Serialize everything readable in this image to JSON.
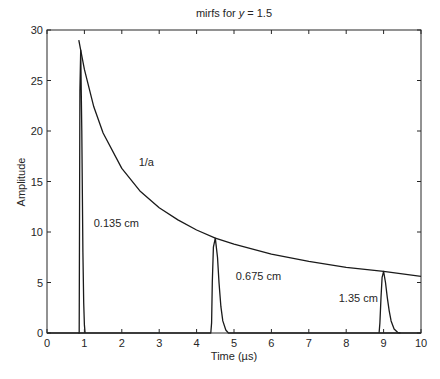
{
  "chart_data": {
    "type": "line",
    "title": "mirfs for y = 1.5",
    "title_prefix": "mirfs for ",
    "title_var": "y",
    "title_suffix": " = 1.5",
    "xlabel": "Time (µs)",
    "ylabel": "Amplitude",
    "xlim": [
      0,
      10
    ],
    "ylim": [
      0,
      30
    ],
    "xticks": [
      0,
      1,
      2,
      3,
      4,
      5,
      6,
      7,
      8,
      9,
      10
    ],
    "yticks": [
      0,
      5,
      10,
      15,
      20,
      25,
      30
    ],
    "grid": false,
    "legend": "none",
    "series": [
      {
        "name": "1/a",
        "x": [
          0.85,
          0.9,
          1.0,
          1.25,
          1.5,
          2.0,
          2.5,
          3.0,
          3.5,
          4.0,
          4.5,
          5.0,
          6.0,
          7.0,
          8.0,
          9.0,
          10.0
        ],
        "y": [
          29.0,
          28.0,
          26.1,
          22.4,
          19.8,
          16.3,
          14.0,
          12.4,
          11.2,
          10.2,
          9.4,
          8.8,
          7.8,
          7.1,
          6.5,
          6.1,
          5.6
        ]
      },
      {
        "name": "0.135 cm",
        "x": [
          0.84,
          0.86,
          0.87,
          0.88,
          0.9,
          0.93,
          0.96,
          0.98,
          1.0,
          1.02
        ],
        "y": [
          0,
          0,
          10,
          24,
          28.0,
          20,
          8,
          3,
          0.8,
          0
        ]
      },
      {
        "name": "0.675 cm",
        "x": [
          0.0,
          4.38,
          4.4,
          4.42,
          4.45,
          4.5,
          4.56,
          4.6,
          4.65,
          4.7,
          4.78,
          4.85,
          10.0
        ],
        "y": [
          0,
          0,
          1,
          5,
          8.5,
          9.4,
          7.5,
          5,
          2.6,
          1.2,
          0.3,
          0,
          0
        ]
      },
      {
        "name": "1.35 cm",
        "x": [
          8.88,
          8.9,
          8.93,
          8.96,
          9.0,
          9.05,
          9.1,
          9.15,
          9.2,
          9.28,
          9.38,
          9.45
        ],
        "y": [
          0,
          1,
          3.5,
          5.5,
          6.1,
          5.0,
          3.5,
          2.2,
          1.2,
          0.4,
          0.05,
          0
        ]
      }
    ],
    "annotations": [
      {
        "text": "1/a",
        "x": 2.45,
        "y": 16.5
      },
      {
        "text": "0.135 cm",
        "x": 1.25,
        "y": 10.5
      },
      {
        "text": "0.675 cm",
        "x": 5.05,
        "y": 5.2
      },
      {
        "text": "1.35 cm",
        "x": 7.8,
        "y": 3.1
      }
    ]
  }
}
